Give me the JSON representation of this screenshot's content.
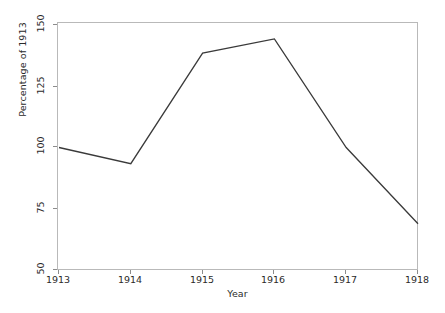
{
  "chart_data": {
    "type": "line",
    "title": "",
    "xlabel": "Year",
    "ylabel": "Percentage of 1913",
    "x": [
      1913,
      1914,
      1915,
      1916,
      1917,
      1918
    ],
    "categories": [
      "1913",
      "1914",
      "1915",
      "1916",
      "1917",
      "1918"
    ],
    "values": [
      100,
      93.4,
      138.5,
      144.3,
      100,
      68.9
    ],
    "series": [
      {
        "name": "Percentage of 1913",
        "values": [
          100,
          93.4,
          138.5,
          144.3,
          100,
          68.9
        ]
      }
    ],
    "xlim": [
      1913,
      1918
    ],
    "ylim": [
      50,
      150
    ],
    "xticks": [
      "1913",
      "1914",
      "1915",
      "1916",
      "1917",
      "1918"
    ],
    "yticks": [
      "50",
      "75",
      "100",
      "125",
      "150"
    ],
    "grid": false,
    "legend": false,
    "line_color": "#3a3a3a",
    "frame_color": "#b9b9b9",
    "background_color": "#ffffff",
    "text_color": "#2b2b2b"
  },
  "axes": {
    "y_title": "Percentage of 1913",
    "x_title": "Year",
    "y_ticks": [
      {
        "label": "150",
        "value": 150
      },
      {
        "label": "125",
        "value": 125
      },
      {
        "label": "100",
        "value": 100
      },
      {
        "label": "75",
        "value": 75
      },
      {
        "label": "50",
        "value": 50
      }
    ],
    "x_ticks": [
      {
        "label": "1913",
        "value": 1913
      },
      {
        "label": "1914",
        "value": 1914
      },
      {
        "label": "1915",
        "value": 1915
      },
      {
        "label": "1916",
        "value": 1916
      },
      {
        "label": "1917",
        "value": 1917
      },
      {
        "label": "1918",
        "value": 1918
      }
    ]
  }
}
